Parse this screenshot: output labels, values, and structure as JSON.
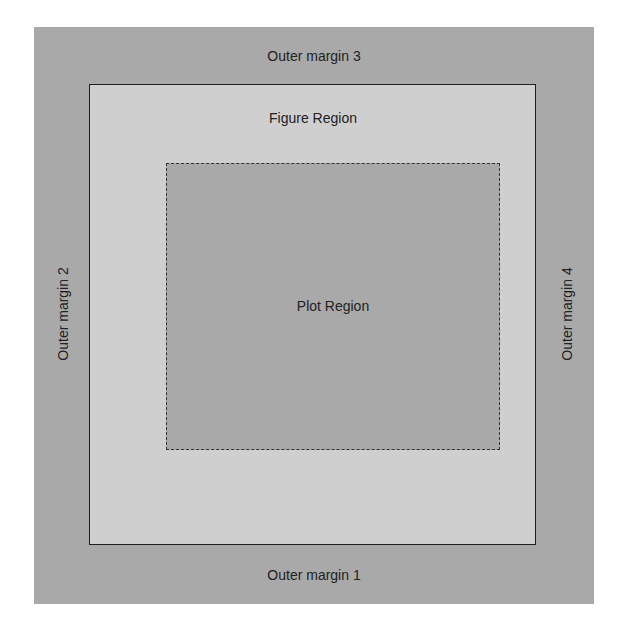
{
  "diagram": {
    "title": "",
    "regions": {
      "outer": {
        "fill": "#a9a9a9",
        "labels": {
          "bottom": "Outer margin 1",
          "left": "Outer margin 2",
          "top": "Outer margin 3",
          "right": "Outer margin 4"
        }
      },
      "figure": {
        "label": "Figure Region",
        "fill": "#cfcfcf",
        "border": "solid"
      },
      "plot": {
        "label": "Plot Region",
        "fill": "#a9a9a9",
        "border": "dashed"
      }
    }
  }
}
